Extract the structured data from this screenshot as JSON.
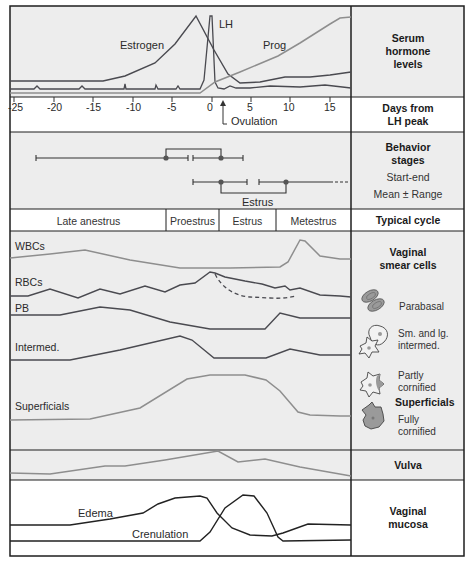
{
  "rows": {
    "serum": {
      "title_lines": [
        "Serum",
        "hormone",
        "levels"
      ]
    },
    "days": {
      "title_lines": [
        "Days from",
        "LH peak"
      ]
    },
    "behavior": {
      "title_lines": [
        "Behavior",
        "stages"
      ],
      "sub1": "Start-end",
      "sub2": "Mean ± Range"
    },
    "cycle": {
      "title": "Typical cycle"
    },
    "smear": {
      "title_lines": [
        "Vaginal",
        "smear cells"
      ]
    },
    "vulva": {
      "title": "Vulva"
    },
    "mucosa": {
      "title_lines": [
        "Vaginal",
        "mucosa"
      ]
    }
  },
  "hormones": {
    "estrogen": "Estrogen",
    "lh": "LH",
    "prog": "Prog"
  },
  "axis": {
    "ticks": [
      "-25",
      "-20",
      "-15",
      "-10",
      "-5",
      "0",
      "5",
      "10",
      "15"
    ],
    "ovulation_label": "Ovulation"
  },
  "behavior": {
    "estrus_label": "Estrus"
  },
  "cycle_stages": [
    {
      "label": "Late anestrus"
    },
    {
      "label": "Proestrus"
    },
    {
      "label": "Estrus"
    },
    {
      "label": "Metestrus"
    }
  ],
  "smear_rows": {
    "wbc": "WBCs",
    "rbc": "RBCs",
    "pb": "PB",
    "intermed": "Intermed.",
    "superficials": "Superficials"
  },
  "legend": {
    "parabasal": "Parabasal",
    "intermed_line1": "Sm. and lg.",
    "intermed_line2": "intermed.",
    "partly_line1": "Partly",
    "partly_line2": "cornified",
    "superficials": "Superficials",
    "fully_line1": "Fully",
    "fully_line2": "cornified"
  },
  "mucosa": {
    "edema": "Edema",
    "crenulation": "Crenulation"
  },
  "colors": {
    "frame": "#1e1e1e",
    "shaded_bg": "#ececec",
    "dark_curve": "#4a4a50",
    "light_curve": "#8e8e8e",
    "cell_fill": "#9a9a9a"
  }
}
